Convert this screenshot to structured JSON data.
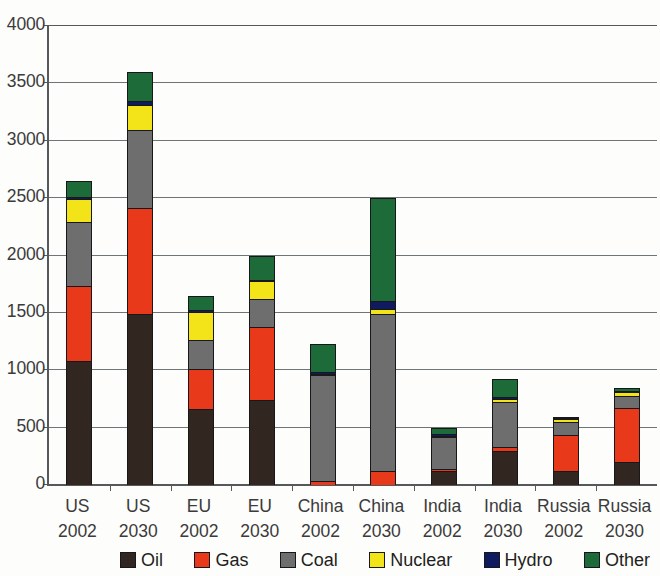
{
  "chart_data": {
    "type": "bar",
    "stacked": true,
    "title": "",
    "xlabel": "",
    "ylabel": "",
    "ylim": [
      0,
      4000
    ],
    "yticks": [
      0,
      500,
      1000,
      1500,
      2000,
      2500,
      3000,
      3500,
      4000
    ],
    "ytick_labels": [
      "0",
      "500",
      "1000",
      "1500",
      "2000",
      "2500",
      "3000",
      "3500",
      "4000"
    ],
    "grid": true,
    "legend_position": "bottom",
    "categories": [
      {
        "line1": "US",
        "line2": "2002"
      },
      {
        "line1": "US",
        "line2": "2030"
      },
      {
        "line1": "EU",
        "line2": "2002"
      },
      {
        "line1": "EU",
        "line2": "2030"
      },
      {
        "line1": "China",
        "line2": "2002"
      },
      {
        "line1": "China",
        "line2": "2030"
      },
      {
        "line1": "India",
        "line2": "2002"
      },
      {
        "line1": "India",
        "line2": "2030"
      },
      {
        "line1": "Russia",
        "line2": "2002"
      },
      {
        "line1": "Russia",
        "line2": "2030"
      }
    ],
    "category_labels": [
      "US 2002",
      "US 2030",
      "EU 2002",
      "EU 2030",
      "China 2002",
      "China 2030",
      "India 2002",
      "India 2030",
      "Russia 2002",
      "Russia 2030"
    ],
    "series": [
      {
        "name": "Oil",
        "color": "#312620",
        "values": [
          1080,
          1490,
          660,
          745,
          0,
          0,
          120,
          295,
          125,
          200
        ]
      },
      {
        "name": "Gas",
        "color": "#e8391a",
        "values": [
          660,
          935,
          360,
          640,
          35,
          125,
          30,
          45,
          320,
          480
        ]
      },
      {
        "name": "Coal",
        "color": "#6e6e6e",
        "values": [
          570,
          685,
          265,
          250,
          930,
          1370,
          290,
          400,
          125,
          110
        ]
      },
      {
        "name": "Nuclear",
        "color": "#f2e419",
        "values": [
          210,
          230,
          250,
          165,
          5,
          60,
          5,
          35,
          35,
          45
        ]
      },
      {
        "name": "Hydro",
        "color": "#101a5e",
        "values": [
          25,
          40,
          25,
          25,
          30,
          75,
          20,
          30,
          15,
          20
        ]
      },
      {
        "name": "Other",
        "color": "#1d6b38",
        "values": [
          145,
          260,
          130,
          215,
          250,
          910,
          65,
          160,
          10,
          35
        ]
      }
    ],
    "totals": [
      2690,
      3640,
      1690,
      2040,
      1250,
      2540,
      530,
      965,
      630,
      890
    ]
  },
  "legend": {
    "items": [
      {
        "label": "Oil",
        "color": "#312620",
        "swatch": "legend-swatch-oil"
      },
      {
        "label": "Gas",
        "color": "#e8391a",
        "swatch": "legend-swatch-gas"
      },
      {
        "label": "Coal",
        "color": "#6e6e6e",
        "swatch": "legend-swatch-coal"
      },
      {
        "label": "Nuclear",
        "color": "#f2e419",
        "swatch": "legend-swatch-nuclear"
      },
      {
        "label": "Hydro",
        "color": "#101a5e",
        "swatch": "legend-swatch-hydro"
      },
      {
        "label": "Other",
        "color": "#1d6b38",
        "swatch": "legend-swatch-other"
      }
    ]
  },
  "axis": {
    "y_top_label": "4000",
    "y_zero_label": "0"
  }
}
